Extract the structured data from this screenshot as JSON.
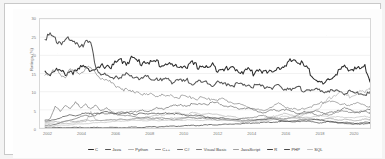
{
  "chart_data": {
    "type": "line",
    "title": "",
    "xlabel": "",
    "ylabel": "Ratings (%)",
    "xlim": [
      2001.5,
      2021.0
    ],
    "ylim": [
      0,
      30
    ],
    "grid": true,
    "legend_position": "bottom",
    "yticks": [
      0,
      5,
      10,
      15,
      20,
      25,
      30
    ],
    "ytick_labels": [
      "0",
      "5",
      "10",
      "15",
      "20",
      "25",
      "30"
    ],
    "xticks": [
      2002,
      2004,
      2006,
      2008,
      2010,
      2012,
      2014,
      2016,
      2018,
      2020
    ],
    "xtick_labels": [
      "2002",
      "2004",
      "2006",
      "2008",
      "2010",
      "2012",
      "2014",
      "2016",
      "2018",
      "2020"
    ],
    "x": [
      2001.8,
      2002.1,
      2002.4,
      2002.7,
      2003.0,
      2003.3,
      2003.6,
      2003.9,
      2004.2,
      2004.5,
      2004.8,
      2005.1,
      2005.4,
      2005.7,
      2006.0,
      2006.3,
      2006.6,
      2006.9,
      2007.2,
      2007.5,
      2007.8,
      2008.1,
      2008.4,
      2008.7,
      2009.0,
      2009.3,
      2009.6,
      2009.9,
      2010.2,
      2010.5,
      2010.8,
      2011.1,
      2011.4,
      2011.7,
      2012.0,
      2012.3,
      2012.6,
      2012.9,
      2013.2,
      2013.5,
      2013.8,
      2014.1,
      2014.4,
      2014.7,
      2015.0,
      2015.3,
      2015.6,
      2015.9,
      2016.2,
      2016.5,
      2016.8,
      2017.1,
      2017.4,
      2017.7,
      2018.0,
      2018.3,
      2018.6,
      2018.9,
      2019.2,
      2019.5,
      2019.8,
      2020.1,
      2020.4,
      2020.7,
      2021.0
    ],
    "series": [
      {
        "name": "C",
        "color": "#2b2b2b",
        "values": [
          15.5,
          15.0,
          16.2,
          15.4,
          14.9,
          15.8,
          15.2,
          16.4,
          17.5,
          16.0,
          15.6,
          16.8,
          17.4,
          16.9,
          17.8,
          18.6,
          18.1,
          19.2,
          18.4,
          17.9,
          18.8,
          17.6,
          18.3,
          17.2,
          18.0,
          17.1,
          16.6,
          17.4,
          16.8,
          17.6,
          16.9,
          17.3,
          16.4,
          17.1,
          16.2,
          16.8,
          15.9,
          16.6,
          16.0,
          15.4,
          16.2,
          15.0,
          16.4,
          15.6,
          14.8,
          16.2,
          17.0,
          16.1,
          17.8,
          19.1,
          18.2,
          17.0,
          15.6,
          14.2,
          12.6,
          11.8,
          13.4,
          14.6,
          15.8,
          16.6,
          15.9,
          16.8,
          16.1,
          17.0,
          13.4
        ]
      },
      {
        "name": "Java",
        "color": "#555555",
        "values": [
          25.7,
          24.9,
          24.2,
          23.8,
          24.4,
          23.4,
          23.9,
          23.1,
          24.0,
          22.6,
          17.2,
          15.0,
          14.1,
          13.6,
          14.4,
          13.8,
          14.6,
          13.9,
          14.2,
          13.4,
          14.0,
          13.2,
          13.8,
          12.9,
          13.5,
          12.8,
          13.4,
          12.6,
          13.1,
          12.4,
          13.0,
          12.2,
          12.8,
          12.0,
          12.6,
          11.9,
          12.4,
          11.7,
          12.2,
          11.5,
          12.0,
          11.4,
          11.8,
          11.1,
          11.6,
          11.0,
          11.5,
          10.8,
          11.2,
          10.6,
          11.0,
          10.4,
          10.8,
          10.2,
          10.6,
          10.0,
          10.4,
          9.8,
          10.2,
          9.6,
          10.0,
          9.4,
          9.8,
          9.2,
          9.6
        ]
      },
      {
        "name": "Python",
        "color": "#b4b4b4",
        "values": [
          1.0,
          1.2,
          1.1,
          1.3,
          1.2,
          1.4,
          1.5,
          1.6,
          1.8,
          4.6,
          2.2,
          2.0,
          2.1,
          2.3,
          2.2,
          2.4,
          2.3,
          2.5,
          2.6,
          2.8,
          3.0,
          3.2,
          3.4,
          3.6,
          3.8,
          4.0,
          4.2,
          4.0,
          3.8,
          4.2,
          4.0,
          3.8,
          4.0,
          3.6,
          3.8,
          3.4,
          3.2,
          3.0,
          2.8,
          2.6,
          2.4,
          2.2,
          2.4,
          2.6,
          2.8,
          3.2,
          3.6,
          4.0,
          3.6,
          3.4,
          3.2,
          3.6,
          4.2,
          4.8,
          5.6,
          6.8,
          8.2,
          9.0,
          9.8,
          9.2,
          8.6,
          9.4,
          10.2,
          9.6,
          11.2
        ]
      },
      {
        "name": "C++",
        "color": "#8a8a8a",
        "values": [
          15.2,
          14.6,
          15.8,
          15.1,
          14.4,
          15.6,
          14.9,
          15.4,
          16.6,
          16.0,
          15.2,
          14.0,
          13.2,
          12.4,
          11.8,
          11.0,
          10.4,
          9.8,
          10.2,
          9.6,
          9.0,
          9.4,
          8.8,
          9.2,
          8.6,
          9.0,
          8.4,
          8.8,
          8.2,
          8.6,
          8.0,
          8.4,
          7.8,
          8.2,
          7.6,
          8.0,
          7.4,
          7.0,
          6.6,
          6.2,
          5.8,
          5.4,
          5.0,
          4.6,
          5.4,
          6.2,
          6.6,
          6.0,
          5.6,
          5.2,
          4.8,
          5.4,
          5.8,
          6.2,
          6.6,
          7.2,
          7.6,
          7.0,
          6.4,
          6.8,
          6.2,
          6.6,
          7.0,
          6.4,
          5.6
        ]
      },
      {
        "name": "C#",
        "color": "#6e6e6e",
        "values": [
          0.6,
          0.8,
          1.0,
          1.4,
          1.8,
          2.2,
          2.6,
          3.0,
          3.4,
          3.2,
          3.6,
          4.0,
          3.8,
          4.2,
          4.0,
          4.4,
          4.2,
          4.6,
          4.4,
          4.8,
          4.6,
          5.0,
          5.4,
          5.2,
          5.8,
          6.2,
          6.0,
          6.4,
          6.2,
          6.6,
          6.4,
          6.8,
          6.6,
          7.0,
          6.8,
          6.4,
          6.0,
          5.6,
          5.2,
          5.6,
          5.4,
          5.0,
          4.6,
          4.2,
          4.6,
          5.0,
          4.8,
          5.2,
          4.8,
          4.4,
          4.0,
          4.4,
          4.2,
          3.8,
          3.4,
          3.8,
          4.2,
          4.6,
          5.0,
          5.4,
          5.0,
          4.6,
          4.2,
          4.6,
          5.2
        ]
      },
      {
        "name": "Visual Basic",
        "color": "#7d7d7d",
        "values": [
          2.2,
          2.6,
          5.8,
          4.6,
          6.4,
          5.2,
          7.0,
          5.6,
          6.8,
          5.0,
          6.2,
          4.8,
          5.6,
          4.4,
          3.8,
          3.6,
          3.4,
          3.2,
          3.0,
          2.8,
          3.0,
          2.6,
          2.8,
          2.4,
          2.6,
          2.2,
          2.4,
          2.6,
          2.8,
          3.0,
          2.6,
          2.8,
          2.4,
          2.6,
          2.2,
          2.4,
          2.0,
          2.2,
          2.4,
          2.6,
          2.8,
          3.0,
          3.2,
          3.4,
          3.0,
          2.8,
          2.6,
          2.4,
          2.8,
          3.2,
          3.6,
          4.0,
          4.4,
          4.8,
          4.4,
          4.0,
          3.6,
          4.0,
          4.4,
          4.8,
          4.4,
          4.0,
          4.4,
          4.8,
          4.2
        ]
      },
      {
        "name": "JavaScript",
        "color": "#a0a0a0",
        "values": [
          1.4,
          1.6,
          1.8,
          1.6,
          1.8,
          2.0,
          1.8,
          2.0,
          2.2,
          2.0,
          2.2,
          2.0,
          2.2,
          2.4,
          2.2,
          2.4,
          2.2,
          2.4,
          2.6,
          2.4,
          2.6,
          2.4,
          2.6,
          2.8,
          2.6,
          2.8,
          2.6,
          2.8,
          3.0,
          2.8,
          3.0,
          2.8,
          3.0,
          2.8,
          2.6,
          2.4,
          2.2,
          2.0,
          1.8,
          1.6,
          1.8,
          2.0,
          2.2,
          2.4,
          2.6,
          2.8,
          2.6,
          2.4,
          2.6,
          2.8,
          3.0,
          2.8,
          2.6,
          2.4,
          2.2,
          2.4,
          2.6,
          2.4,
          2.2,
          2.4,
          2.2,
          2.0,
          2.2,
          2.4,
          2.2
        ]
      },
      {
        "name": "R",
        "color": "#3f3f3f",
        "values": [
          0.1,
          0.1,
          0.1,
          0.1,
          0.1,
          0.1,
          0.1,
          0.1,
          0.1,
          0.1,
          0.1,
          0.1,
          0.1,
          0.1,
          0.1,
          0.1,
          0.1,
          0.2,
          0.2,
          0.2,
          0.3,
          0.3,
          0.3,
          0.4,
          0.4,
          0.5,
          0.5,
          0.6,
          0.6,
          0.7,
          0.7,
          0.8,
          0.8,
          0.9,
          0.9,
          1.0,
          1.0,
          1.1,
          1.2,
          1.2,
          1.3,
          1.4,
          1.4,
          1.5,
          1.6,
          1.6,
          1.7,
          1.8,
          1.9,
          2.0,
          2.1,
          2.2,
          2.3,
          2.4,
          2.2,
          2.0,
          1.8,
          1.6,
          1.4,
          1.3,
          1.2,
          1.1,
          1.0,
          1.2,
          1.4
        ]
      },
      {
        "name": "PHP",
        "color": "#4a4a4a",
        "values": [
          1.8,
          2.0,
          2.4,
          2.8,
          3.2,
          3.6,
          3.4,
          3.8,
          4.0,
          3.8,
          4.2,
          4.0,
          4.4,
          4.2,
          4.0,
          3.8,
          4.2,
          4.0,
          3.8,
          4.0,
          3.8,
          4.2,
          4.0,
          3.8,
          4.2,
          4.0,
          3.8,
          3.6,
          3.4,
          3.6,
          3.4,
          3.2,
          3.0,
          2.8,
          2.6,
          2.8,
          2.6,
          2.4,
          2.2,
          2.0,
          2.2,
          2.0,
          2.2,
          2.4,
          2.6,
          2.4,
          2.2,
          2.0,
          1.8,
          1.6,
          1.8,
          2.0,
          1.8,
          1.6,
          1.4,
          1.6,
          1.8,
          1.6,
          1.4,
          1.6,
          1.4,
          1.2,
          1.4,
          1.6,
          1.4
        ]
      },
      {
        "name": "SQL",
        "color": "#c2c2c2",
        "values": [
          0.4,
          0.5,
          0.6,
          0.7,
          0.8,
          0.9,
          1.0,
          1.1,
          1.2,
          1.3,
          1.4,
          1.5,
          1.6,
          1.7,
          1.8,
          1.9,
          2.0,
          2.1,
          2.0,
          2.1,
          2.0,
          2.1,
          2.0,
          2.1,
          2.2,
          2.1,
          2.2,
          2.1,
          2.2,
          2.1,
          2.2,
          2.1,
          2.2,
          2.1,
          2.2,
          2.1,
          2.0,
          2.1,
          2.0,
          1.9,
          2.0,
          1.9,
          2.0,
          1.9,
          2.0,
          2.4,
          2.8,
          3.2,
          3.0,
          2.8,
          2.6,
          2.8,
          3.0,
          3.2,
          3.4,
          3.2,
          3.0,
          3.2,
          3.0,
          2.8,
          3.0,
          2.8,
          3.0,
          3.2,
          3.0
        ]
      }
    ]
  },
  "legend": {
    "items": [
      {
        "label": "C"
      },
      {
        "label": "Java"
      },
      {
        "label": "Python"
      },
      {
        "label": "C++"
      },
      {
        "label": "C#"
      },
      {
        "label": "Visual Basic"
      },
      {
        "label": "JavaScript"
      },
      {
        "label": "R"
      },
      {
        "label": "PHP"
      },
      {
        "label": "SQL"
      }
    ]
  }
}
